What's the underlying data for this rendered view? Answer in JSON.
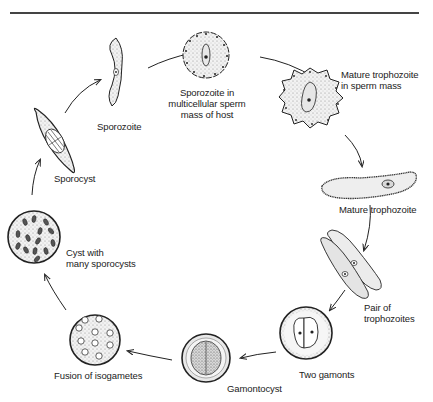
{
  "figure": {
    "type": "life-cycle diagram",
    "stages": [
      {
        "id": "sporozoite",
        "label": "Sporozoite"
      },
      {
        "id": "sporozoite-in-sperm-mass",
        "label_lines": [
          "Sporozoite in",
          "multicellular sperm",
          "mass of host"
        ]
      },
      {
        "id": "mature-trophozoite-in-sperm-mass",
        "label_lines": [
          "Mature trophozoite",
          "in sperm mass"
        ]
      },
      {
        "id": "mature-trophozoite",
        "label": "Mature trophozoite"
      },
      {
        "id": "pair-of-trophozoites",
        "label_lines": [
          "Pair of",
          "trophozoites"
        ]
      },
      {
        "id": "two-gamonts",
        "label": "Two gamonts"
      },
      {
        "id": "gamontocyst",
        "label": "Gamontocyst"
      },
      {
        "id": "fusion-of-isogametes",
        "label": "Fusion of isogametes"
      },
      {
        "id": "cyst-with-many-sporocysts",
        "label_lines": [
          "Cyst with",
          "many sporocysts"
        ]
      },
      {
        "id": "sporocyst",
        "label": "Sporocyst"
      }
    ],
    "colors": {
      "ink": "#222222",
      "stipple": "#9a9a9a",
      "cell_fill": "#ececec",
      "rule": "#444444"
    }
  }
}
